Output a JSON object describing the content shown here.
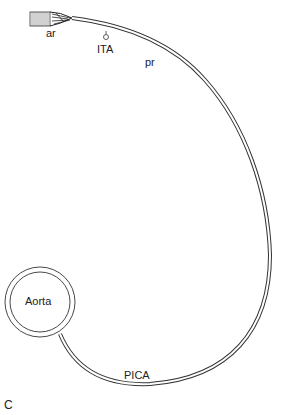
{
  "figure": {
    "panel_label": "C",
    "labels": {
      "ar": "ar",
      "ita": "ITA",
      "pr": "pr",
      "aorta": "Aorta",
      "pica": "PICA"
    },
    "colors": {
      "stroke": "#333333",
      "background": "#ffffff"
    }
  }
}
